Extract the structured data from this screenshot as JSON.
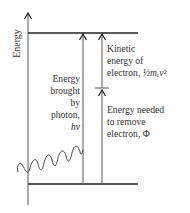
{
  "diagram": {
    "axis": {
      "label": "Energy"
    },
    "photon": {
      "lines": [
        "Energy",
        "brought",
        "by",
        "photon,",
        "hν"
      ]
    },
    "kinetic": {
      "lines": [
        "Kinetic",
        "energy of",
        "electron,"
      ],
      "formula": "½mₑv²"
    },
    "work_function": {
      "lines": [
        "Energy needed",
        "to remove",
        "electron, Φ"
      ]
    },
    "colors": {
      "line": "#222222",
      "wave": "#444444",
      "text": "#333333"
    }
  }
}
